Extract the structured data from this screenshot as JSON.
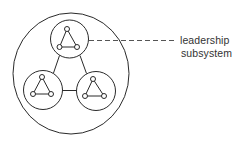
{
  "diagram": {
    "type": "nested-system",
    "annotation": {
      "line1": "leadership",
      "line2": "subsystem",
      "points_to": "top subsystem"
    },
    "outer_system": {
      "cx": 71,
      "cy": 73.5,
      "rx": 58,
      "ry": 60.5
    },
    "subsystems": [
      {
        "id": "top",
        "cx": 69.5,
        "cy": 39,
        "r": 19,
        "nodes": [
          [
            67,
            29
          ],
          [
            59.5,
            47
          ],
          [
            77,
            47
          ]
        ]
      },
      {
        "id": "bottom-left",
        "cx": 43,
        "cy": 90,
        "r": 19.5,
        "nodes": [
          [
            42,
            77
          ],
          [
            33,
            94
          ],
          [
            51,
            94
          ]
        ]
      },
      {
        "id": "bottom-right",
        "cx": 96,
        "cy": 91,
        "r": 19.5,
        "nodes": [
          [
            93,
            79
          ],
          [
            85,
            96
          ],
          [
            104,
            96
          ]
        ]
      }
    ],
    "connections": [
      [
        "top",
        "bottom-left"
      ],
      [
        "top",
        "bottom-right"
      ],
      [
        "bottom-left",
        "bottom-right"
      ]
    ],
    "colors": {
      "stroke": "#2a2a2a",
      "dashed": "#555555",
      "text": "#333333"
    }
  }
}
